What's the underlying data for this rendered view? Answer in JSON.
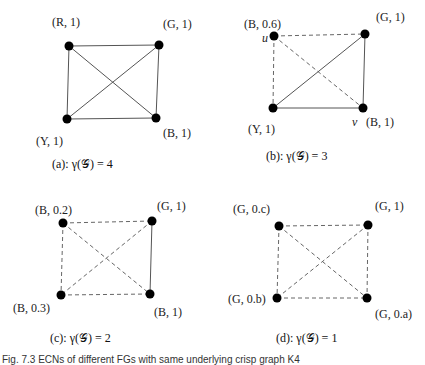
{
  "figure_caption": "Fig. 7.3 ECNs of different FGs with same underlying crisp graph K4",
  "panels": [
    {
      "id": "a",
      "caption": "(a): γ(𝒢) = 4",
      "nodes": [
        {
          "id": "tl",
          "x": 69,
          "y": 46,
          "label": "(R, 1)",
          "lx": 52,
          "ly": 26
        },
        {
          "id": "tr",
          "x": 159,
          "y": 45,
          "label": "(G, 1)",
          "lx": 163,
          "ly": 28
        },
        {
          "id": "bl",
          "x": 67,
          "y": 119,
          "label": "(Y, 1)",
          "lx": 36,
          "ly": 145
        },
        {
          "id": "br",
          "x": 156,
          "y": 118,
          "label": "(B, 1)",
          "lx": 163,
          "ly": 137
        }
      ],
      "edges": [
        {
          "from": "tl",
          "to": "tr",
          "style": "solid"
        },
        {
          "from": "tl",
          "to": "bl",
          "style": "solid"
        },
        {
          "from": "tr",
          "to": "br",
          "style": "solid"
        },
        {
          "from": "bl",
          "to": "br",
          "style": "solid"
        },
        {
          "from": "tl",
          "to": "br",
          "style": "solid"
        },
        {
          "from": "tr",
          "to": "bl",
          "style": "solid"
        }
      ],
      "caption_pos": {
        "x": 52,
        "y": 168
      }
    },
    {
      "id": "b",
      "caption": "(b): γ(𝒢) = 3",
      "nodes": [
        {
          "id": "tl",
          "x": 274,
          "y": 36,
          "label": "(B, 0.6)",
          "lx": 244,
          "ly": 28,
          "tag": "u",
          "tx": 262,
          "ty": 42
        },
        {
          "id": "tr",
          "x": 365,
          "y": 34,
          "label": "(G, 1)",
          "lx": 376,
          "ly": 21
        },
        {
          "id": "bl",
          "x": 273,
          "y": 108,
          "label": "(Y, 1)",
          "lx": 248,
          "ly": 133
        },
        {
          "id": "br",
          "x": 363,
          "y": 108,
          "label": "(B, 1)",
          "lx": 366,
          "ly": 126,
          "tag": "v",
          "tx": 352,
          "ty": 126
        }
      ],
      "edges": [
        {
          "from": "tl",
          "to": "tr",
          "style": "dashed"
        },
        {
          "from": "tl",
          "to": "bl",
          "style": "dashed"
        },
        {
          "from": "tl",
          "to": "br",
          "style": "dashed"
        },
        {
          "from": "tr",
          "to": "br",
          "style": "solid"
        },
        {
          "from": "tr",
          "to": "bl",
          "style": "solid"
        },
        {
          "from": "bl",
          "to": "br",
          "style": "solid"
        }
      ],
      "caption_pos": {
        "x": 266,
        "y": 160
      }
    },
    {
      "id": "c",
      "caption": "(c): γ(𝒢) = 2",
      "nodes": [
        {
          "id": "tl",
          "x": 63,
          "y": 223,
          "label": "(B, 0.2)",
          "lx": 35,
          "ly": 214
        },
        {
          "id": "tr",
          "x": 152,
          "y": 221,
          "label": "(G, 1)",
          "lx": 157,
          "ly": 210
        },
        {
          "id": "bl",
          "x": 61,
          "y": 295,
          "label": "(B, 0.3)",
          "lx": 13,
          "ly": 312
        },
        {
          "id": "br",
          "x": 150,
          "y": 294,
          "label": "(B, 1)",
          "lx": 154,
          "ly": 316
        }
      ],
      "edges": [
        {
          "from": "tl",
          "to": "tr",
          "style": "dashed"
        },
        {
          "from": "tl",
          "to": "bl",
          "style": "dashed"
        },
        {
          "from": "tl",
          "to": "br",
          "style": "dashed"
        },
        {
          "from": "tr",
          "to": "bl",
          "style": "dashed"
        },
        {
          "from": "bl",
          "to": "br",
          "style": "dashed"
        },
        {
          "from": "tr",
          "to": "br",
          "style": "solid"
        }
      ],
      "caption_pos": {
        "x": 50,
        "y": 342
      }
    },
    {
      "id": "d",
      "caption": "(d): γ(𝒢) = 1",
      "nodes": [
        {
          "id": "tl",
          "x": 279,
          "y": 226,
          "label": "(G, 0.c)",
          "lx": 233,
          "ly": 213
        },
        {
          "id": "tr",
          "x": 368,
          "y": 225,
          "label": "(G, 1)",
          "lx": 375,
          "ly": 210
        },
        {
          "id": "bl",
          "x": 277,
          "y": 298,
          "label": "(G, 0.b)",
          "lx": 228,
          "ly": 303
        },
        {
          "id": "br",
          "x": 367,
          "y": 298,
          "label": "(G, 0.a)",
          "lx": 375,
          "ly": 318
        }
      ],
      "edges": [
        {
          "from": "tl",
          "to": "tr",
          "style": "dashed"
        },
        {
          "from": "tl",
          "to": "bl",
          "style": "dashed"
        },
        {
          "from": "tl",
          "to": "br",
          "style": "dashed"
        },
        {
          "from": "tr",
          "to": "bl",
          "style": "dashed"
        },
        {
          "from": "tr",
          "to": "br",
          "style": "dashed"
        },
        {
          "from": "bl",
          "to": "br",
          "style": "dashed"
        }
      ],
      "caption_pos": {
        "x": 276,
        "y": 342
      }
    }
  ]
}
